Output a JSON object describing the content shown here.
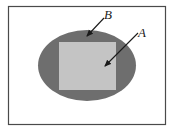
{
  "diagram": {
    "frame": {
      "x": 8,
      "y": 6,
      "width": 157,
      "height": 118,
      "stroke": "#4a4a4a",
      "fill": "#ffffff"
    },
    "outer_region": {
      "shape": "ellipse",
      "cx": 87,
      "cy": 65.5,
      "rx": 49,
      "ry": 35.5,
      "fill": "#6e6e6e"
    },
    "inner_region": {
      "shape": "rectangle",
      "x": 59,
      "y": 42,
      "width": 57,
      "height": 48,
      "fill": "#c4c4c4"
    },
    "labels": [
      {
        "id": "B",
        "text": "B",
        "x": 106,
        "y": 20,
        "arrow": {
          "from": [
            104,
            18
          ],
          "to": [
            86,
            37
          ]
        }
      },
      {
        "id": "A",
        "text": "A",
        "x": 139,
        "y": 37,
        "arrow": {
          "from": [
            138,
            33
          ],
          "to": [
            104,
            67
          ]
        }
      }
    ]
  }
}
